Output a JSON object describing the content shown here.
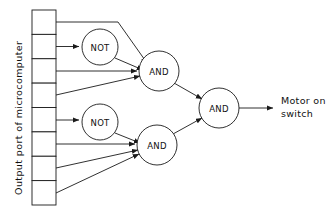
{
  "diagram": {
    "port_label": "Output port of microcomputer",
    "output_label_line1": "Motor on",
    "output_label_line2": "switch",
    "colors": {
      "line": "#1a1a1a",
      "background": "#ffffff",
      "text": "#111111"
    },
    "register": {
      "name": "output-port-register",
      "cell_count": 8,
      "x": 32,
      "y": 10,
      "width": 24,
      "height": 195,
      "cells": [
        {
          "index": 1,
          "label": ""
        },
        {
          "index": 2,
          "label": ""
        },
        {
          "index": 3,
          "label": ""
        },
        {
          "index": 4,
          "label": ""
        },
        {
          "index": 5,
          "label": ""
        },
        {
          "index": 6,
          "label": ""
        },
        {
          "index": 7,
          "label": ""
        },
        {
          "index": 8,
          "label": ""
        }
      ]
    },
    "gates": [
      {
        "id": "not1",
        "type": "NOT",
        "label": "NOT",
        "cx": 100,
        "cy": 47,
        "r": 18
      },
      {
        "id": "not2",
        "type": "NOT",
        "label": "NOT",
        "cx": 100,
        "cy": 122,
        "r": 18
      },
      {
        "id": "and1",
        "type": "AND",
        "label": "AND",
        "cx": 159,
        "cy": 71,
        "r": 20
      },
      {
        "id": "and2",
        "type": "AND",
        "label": "AND",
        "cx": 157,
        "cy": 145,
        "r": 20
      },
      {
        "id": "and3",
        "type": "AND",
        "label": "AND",
        "cx": 219,
        "cy": 108,
        "r": 20
      }
    ],
    "connections": [
      {
        "from": "register-cell-1",
        "to": "and1",
        "kind": "routed"
      },
      {
        "from": "register-cell-2",
        "to": "not1",
        "kind": "straight"
      },
      {
        "from": "not1",
        "to": "and1",
        "kind": "diagonal"
      },
      {
        "from": "register-cell-3",
        "to": "and1",
        "kind": "straight"
      },
      {
        "from": "register-cell-4",
        "to": "and1",
        "kind": "diagonal"
      },
      {
        "from": "register-cell-5",
        "to": "not2",
        "kind": "straight"
      },
      {
        "from": "not2",
        "to": "and2",
        "kind": "diagonal"
      },
      {
        "from": "register-cell-6",
        "to": "and2",
        "kind": "straight"
      },
      {
        "from": "register-cell-7",
        "to": "and2",
        "kind": "diagonal"
      },
      {
        "from": "register-cell-8",
        "to": "and2",
        "kind": "diagonal"
      },
      {
        "from": "and1",
        "to": "and3",
        "kind": "diagonal"
      },
      {
        "from": "and2",
        "to": "and3",
        "kind": "diagonal"
      },
      {
        "from": "and3",
        "to": "motor-on-switch",
        "kind": "straight"
      }
    ]
  }
}
